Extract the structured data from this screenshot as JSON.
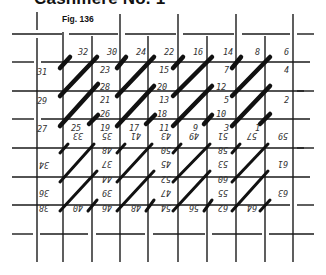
{
  "header": {
    "title": "Cashmere No. 1",
    "figure_label": "Fig. 136"
  },
  "diagram": {
    "type": "needlepoint-stitch-diagram",
    "stitch_color": "#111111",
    "grid_color": "#1a1a1a",
    "labels_upright": [
      {
        "text": "32",
        "x": 78,
        "y": 55
      },
      {
        "text": "30",
        "x": 107,
        "y": 55
      },
      {
        "text": "24",
        "x": 136,
        "y": 55
      },
      {
        "text": "22",
        "x": 164,
        "y": 55
      },
      {
        "text": "16",
        "x": 193,
        "y": 55
      },
      {
        "text": "14",
        "x": 223,
        "y": 55
      },
      {
        "text": "8",
        "x": 255,
        "y": 55
      },
      {
        "text": "6",
        "x": 284,
        "y": 55
      },
      {
        "text": "31",
        "x": 37,
        "y": 75
      },
      {
        "text": "23",
        "x": 100,
        "y": 73
      },
      {
        "text": "15",
        "x": 159,
        "y": 73
      },
      {
        "text": "7",
        "x": 224,
        "y": 73
      },
      {
        "text": "4",
        "x": 284,
        "y": 73
      },
      {
        "text": "28",
        "x": 100,
        "y": 90
      },
      {
        "text": "20",
        "x": 157,
        "y": 90
      },
      {
        "text": "12",
        "x": 216,
        "y": 90
      },
      {
        "text": "29",
        "x": 37,
        "y": 104
      },
      {
        "text": "21",
        "x": 100,
        "y": 103
      },
      {
        "text": "13",
        "x": 159,
        "y": 103
      },
      {
        "text": "5",
        "x": 224,
        "y": 103
      },
      {
        "text": "2",
        "x": 284,
        "y": 103
      },
      {
        "text": "26",
        "x": 100,
        "y": 117
      },
      {
        "text": "18",
        "x": 157,
        "y": 117
      },
      {
        "text": "10",
        "x": 216,
        "y": 117
      },
      {
        "text": "27",
        "x": 37,
        "y": 132
      },
      {
        "text": "25",
        "x": 71,
        "y": 131
      },
      {
        "text": "19",
        "x": 100,
        "y": 131
      },
      {
        "text": "17",
        "x": 129,
        "y": 131
      },
      {
        "text": "11",
        "x": 159,
        "y": 131
      },
      {
        "text": "9",
        "x": 193,
        "y": 131
      },
      {
        "text": "3",
        "x": 224,
        "y": 131
      },
      {
        "text": "1",
        "x": 255,
        "y": 131
      }
    ],
    "labels_inverted": [
      {
        "text": "33",
        "x": 71,
        "y": 140
      },
      {
        "text": "35",
        "x": 100,
        "y": 140
      },
      {
        "text": "41",
        "x": 129,
        "y": 140
      },
      {
        "text": "43",
        "x": 159,
        "y": 140
      },
      {
        "text": "49",
        "x": 187,
        "y": 140
      },
      {
        "text": "51",
        "x": 216,
        "y": 140
      },
      {
        "text": "57",
        "x": 245,
        "y": 140
      },
      {
        "text": "59",
        "x": 276,
        "y": 140
      },
      {
        "text": "48",
        "x": 100,
        "y": 154
      },
      {
        "text": "50",
        "x": 159,
        "y": 154
      },
      {
        "text": "58",
        "x": 216,
        "y": 154
      },
      {
        "text": "34",
        "x": 37,
        "y": 169
      },
      {
        "text": "37",
        "x": 100,
        "y": 168
      },
      {
        "text": "45",
        "x": 159,
        "y": 168
      },
      {
        "text": "53",
        "x": 216,
        "y": 168
      },
      {
        "text": "61",
        "x": 276,
        "y": 168
      },
      {
        "text": "44",
        "x": 100,
        "y": 183
      },
      {
        "text": "52",
        "x": 159,
        "y": 183
      },
      {
        "text": "60",
        "x": 216,
        "y": 183
      },
      {
        "text": "36",
        "x": 37,
        "y": 197
      },
      {
        "text": "39",
        "x": 100,
        "y": 197
      },
      {
        "text": "47",
        "x": 159,
        "y": 197
      },
      {
        "text": "55",
        "x": 216,
        "y": 197
      },
      {
        "text": "63",
        "x": 276,
        "y": 197
      },
      {
        "text": "38",
        "x": 37,
        "y": 212
      },
      {
        "text": "40",
        "x": 71,
        "y": 212
      },
      {
        "text": "46",
        "x": 100,
        "y": 212
      },
      {
        "text": "48",
        "x": 129,
        "y": 212
      },
      {
        "text": "54",
        "x": 159,
        "y": 212
      },
      {
        "text": "56",
        "x": 187,
        "y": 212
      },
      {
        "text": "62",
        "x": 216,
        "y": 212
      },
      {
        "text": "64",
        "x": 245,
        "y": 212
      }
    ]
  }
}
